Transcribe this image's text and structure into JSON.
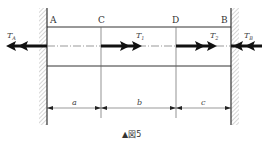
{
  "figure": {
    "caption": "▲図5",
    "points": {
      "A": "A",
      "C": "C",
      "D": "D",
      "B": "B"
    },
    "forces": {
      "TA": {
        "base": "T",
        "sub": "A"
      },
      "T1": {
        "base": "T",
        "sub": "1"
      },
      "T2": {
        "base": "T",
        "sub": "2"
      },
      "TB": {
        "base": "T",
        "sub": "B"
      }
    },
    "dimensions": {
      "a": "a",
      "b": "b",
      "c": "c"
    },
    "colors": {
      "line": "#333333",
      "arrow": "#111111",
      "hatch": "#888888"
    }
  }
}
